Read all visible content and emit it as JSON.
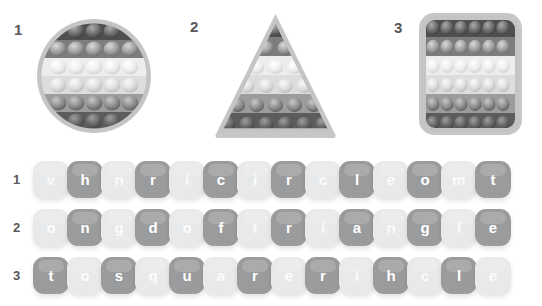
{
  "toys": [
    {
      "number": "1",
      "shape": "circle",
      "name": "popit-circle",
      "rows": [
        3,
        5,
        5,
        5,
        5,
        3
      ],
      "band_colors": [
        "#4f4f51",
        "#7c7d7f",
        "#eceded",
        "#dcdddd",
        "#9b9c9e",
        "#5b5c5e"
      ],
      "frame_color": "#b9babb"
    },
    {
      "number": "2",
      "shape": "triangle",
      "name": "popit-triangle",
      "rows": [
        1,
        2,
        3,
        4,
        5,
        6
      ],
      "band_colors": [
        "#4f4f51",
        "#7c7d7f",
        "#eceded",
        "#dcdddd",
        "#9b9c9e",
        "#5b5c5e"
      ],
      "frame_color": "#b9babb"
    },
    {
      "number": "3",
      "shape": "square",
      "name": "popit-square",
      "rows": [
        6,
        6,
        6,
        6,
        6,
        6
      ],
      "band_colors": [
        "#4f4f51",
        "#7c7d7f",
        "#eceded",
        "#dcdddd",
        "#9b9c9e",
        "#5b5c5e"
      ],
      "frame_color": "#b9babb"
    }
  ],
  "letter_rows": [
    {
      "number": "1",
      "letters": [
        "v",
        "h",
        "n",
        "r",
        "i",
        "c",
        "i",
        "r",
        "c",
        "l",
        "e",
        "o",
        "m",
        "t"
      ],
      "tones": [
        "light",
        "dark",
        "light",
        "dark",
        "light",
        "dark",
        "light",
        "dark",
        "light",
        "dark",
        "light",
        "dark",
        "light",
        "dark"
      ]
    },
    {
      "number": "2",
      "letters": [
        "o",
        "n",
        "g",
        "d",
        "o",
        "f",
        "t",
        "r",
        "i",
        "a",
        "n",
        "g",
        "l",
        "e"
      ],
      "tones": [
        "light",
        "dark",
        "light",
        "dark",
        "light",
        "dark",
        "light",
        "dark",
        "light",
        "dark",
        "light",
        "dark",
        "light",
        "dark"
      ]
    },
    {
      "number": "3",
      "letters": [
        "t",
        "o",
        "s",
        "q",
        "u",
        "a",
        "r",
        "e",
        "r",
        "i",
        "h",
        "c",
        "l",
        "e"
      ],
      "tones": [
        "dark",
        "light",
        "dark",
        "light",
        "dark",
        "light",
        "dark",
        "light",
        "dark",
        "light",
        "dark",
        "light",
        "dark",
        "light"
      ]
    }
  ],
  "colors": {
    "background": "#ffffff",
    "number_text": "#58585b",
    "tile_light": "#e8e9ea",
    "tile_dark": "#9a9b9d",
    "tile_letter_text": "#ffffff"
  }
}
